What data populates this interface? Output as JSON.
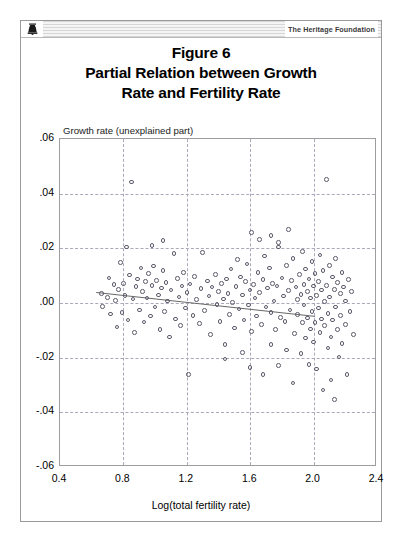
{
  "header": {
    "brand": "The Heritage Foundation",
    "logo_icon": "liberty-bell-icon"
  },
  "title": {
    "line1": "Figure 6",
    "line2": "Partial Relation between Growth",
    "line3": "Rate and Fertility Rate"
  },
  "chart_data": {
    "type": "scatter",
    "xlabel": "Log(total fertility rate)",
    "ylabel": "Growth rate (unexplained part)",
    "xlim": [
      0.4,
      2.4
    ],
    "ylim": [
      -0.06,
      0.06
    ],
    "xticks": [
      "0.4",
      "0.8",
      "1.2",
      "1.6",
      "2.0",
      "2.4"
    ],
    "xtick_values": [
      0.4,
      0.8,
      1.2,
      1.6,
      2.0,
      2.4
    ],
    "yticks": [
      ".06",
      ".04",
      ".02",
      ".00",
      "-.02",
      "-.04",
      "-.06"
    ],
    "ytick_values": [
      0.06,
      0.04,
      0.02,
      0.0,
      -0.02,
      -0.04,
      -0.06
    ],
    "grid": true,
    "grid_style": "dashed",
    "legend": null,
    "marker": "open-circle",
    "marker_color": "#5b5b6b",
    "fit_line": {
      "label": "regression line",
      "color": "#666666",
      "x_start": 0.63,
      "y_start": 0.0035,
      "x_end": 2.02,
      "y_end": -0.0053
    },
    "points": [
      [
        0.66,
        0.0035
      ],
      [
        0.67,
        -0.0012
      ],
      [
        0.7,
        0.002
      ],
      [
        0.71,
        0.0092
      ],
      [
        0.72,
        -0.004
      ],
      [
        0.74,
        0.0068
      ],
      [
        0.75,
        0.001
      ],
      [
        0.76,
        -0.0088
      ],
      [
        0.77,
        0.005
      ],
      [
        0.78,
        0.0148
      ],
      [
        0.79,
        -0.0035
      ],
      [
        0.8,
        0.0072
      ],
      [
        0.81,
        0.0028
      ],
      [
        0.82,
        0.0205
      ],
      [
        0.83,
        -0.0062
      ],
      [
        0.84,
        0.0102
      ],
      [
        0.85,
        0.0442
      ],
      [
        0.86,
        0.0015
      ],
      [
        0.87,
        -0.0108
      ],
      [
        0.88,
        0.006
      ],
      [
        0.89,
        0.0088
      ],
      [
        0.9,
        -0.0025
      ],
      [
        0.91,
        0.0128
      ],
      [
        0.92,
        0.0042
      ],
      [
        0.93,
        -0.007
      ],
      [
        0.94,
        0.0078
      ],
      [
        0.95,
        0.0018
      ],
      [
        0.96,
        0.0108
      ],
      [
        0.97,
        -0.0048
      ],
      [
        0.98,
        0.0065
      ],
      [
        0.99,
        0.0135
      ],
      [
        1.0,
        -0.0015
      ],
      [
        1.01,
        0.0082
      ],
      [
        1.02,
        0.003
      ],
      [
        1.03,
        -0.0098
      ],
      [
        1.04,
        0.0055
      ],
      [
        1.05,
        0.0118
      ],
      [
        1.06,
        -0.0032
      ],
      [
        1.07,
        0.0075
      ],
      [
        1.08,
        0.0008
      ],
      [
        1.09,
        -0.0125
      ],
      [
        1.1,
        0.0048
      ],
      [
        1.12,
        0.0182
      ],
      [
        1.13,
        -0.0058
      ],
      [
        1.14,
        0.009
      ],
      [
        1.15,
        0.0022
      ],
      [
        1.16,
        -0.0082
      ],
      [
        1.17,
        0.0062
      ],
      [
        1.18,
        0.0112
      ],
      [
        1.19,
        -0.0018
      ],
      [
        1.2,
        0.0038
      ],
      [
        1.21,
        -0.0262
      ],
      [
        1.22,
        0.007
      ],
      [
        1.24,
        -0.0045
      ],
      [
        1.25,
        0.0098
      ],
      [
        1.26,
        0.0012
      ],
      [
        1.28,
        -0.0075
      ],
      [
        1.29,
        0.0052
      ],
      [
        1.3,
        0.0185
      ],
      [
        1.31,
        -0.0028
      ],
      [
        1.33,
        0.008
      ],
      [
        1.34,
        0.0025
      ],
      [
        1.35,
        -0.0115
      ],
      [
        1.36,
        0.0058
      ],
      [
        1.38,
        0.0105
      ],
      [
        1.39,
        -0.0005
      ],
      [
        1.4,
        0.0042
      ],
      [
        1.41,
        -0.0068
      ],
      [
        1.42,
        0.0072
      ],
      [
        1.43,
        0.0015
      ],
      [
        1.44,
        -0.0152
      ],
      [
        1.45,
        0.0088
      ],
      [
        1.46,
        0.0035
      ],
      [
        1.47,
        -0.0042
      ],
      [
        1.48,
        0.0125
      ],
      [
        1.49,
        0.0002
      ],
      [
        1.5,
        -0.0092
      ],
      [
        1.51,
        0.006
      ],
      [
        1.52,
        0.016
      ],
      [
        1.53,
        -0.0022
      ],
      [
        1.54,
        0.0095
      ],
      [
        1.55,
        0.003
      ],
      [
        1.56,
        -0.0062
      ],
      [
        1.57,
        0.0078
      ],
      [
        1.58,
        0.0142
      ],
      [
        1.59,
        -0.0008
      ],
      [
        1.6,
        0.0048
      ],
      [
        1.61,
        -0.0105
      ],
      [
        1.62,
        0.0068
      ],
      [
        1.63,
        0.0018
      ],
      [
        1.64,
        -0.0048
      ],
      [
        1.65,
        0.0112
      ],
      [
        1.66,
        0.0038
      ],
      [
        1.67,
        -0.0078
      ],
      [
        1.68,
        0.0085
      ],
      [
        1.69,
        0.0172
      ],
      [
        1.7,
        -0.0015
      ],
      [
        1.71,
        0.0055
      ],
      [
        1.72,
        0.0128
      ],
      [
        1.73,
        -0.0035
      ],
      [
        1.74,
        0.0072
      ],
      [
        1.75,
        0.0008
      ],
      [
        1.76,
        -0.0098
      ],
      [
        1.77,
        0.0062
      ],
      [
        1.78,
        0.0205
      ],
      [
        1.79,
        -0.0052
      ],
      [
        1.8,
        0.0092
      ],
      [
        1.81,
        0.0025
      ],
      [
        1.82,
        -0.0068
      ],
      [
        1.83,
        0.0138
      ],
      [
        1.84,
        0.0045
      ],
      [
        1.85,
        -0.0025
      ],
      [
        1.86,
        0.0082
      ],
      [
        1.87,
        0.0162
      ],
      [
        1.88,
        -0.0112
      ],
      [
        1.89,
        0.0058
      ],
      [
        1.9,
        0.0012
      ],
      [
        1.9,
        -0.0042
      ],
      [
        1.91,
        0.0105
      ],
      [
        1.92,
        -0.0185
      ],
      [
        1.92,
        0.0032
      ],
      [
        1.93,
        -0.0072
      ],
      [
        1.93,
        0.0188
      ],
      [
        1.94,
        0.0068
      ],
      [
        1.94,
        -0.0008
      ],
      [
        1.95,
        0.0125
      ],
      [
        1.95,
        -0.0128
      ],
      [
        1.96,
        0.0042
      ],
      [
        1.96,
        -0.0055
      ],
      [
        1.97,
        0.0088
      ],
      [
        1.97,
        -0.0225
      ],
      [
        1.98,
        0.0018
      ],
      [
        1.98,
        -0.0095
      ],
      [
        1.99,
        0.0152
      ],
      [
        1.99,
        -0.0032
      ],
      [
        2.0,
        0.0062
      ],
      [
        2.0,
        -0.0142
      ],
      [
        2.01,
        0.0108
      ],
      [
        2.01,
        -0.0072
      ],
      [
        2.02,
        0.0028
      ],
      [
        2.02,
        -0.0242
      ],
      [
        2.03,
        0.0078
      ],
      [
        2.03,
        -0.0018
      ],
      [
        2.04,
        0.0175
      ],
      [
        2.04,
        -0.0108
      ],
      [
        2.05,
        0.0048
      ],
      [
        2.05,
        -0.0058
      ],
      [
        2.06,
        0.0118
      ],
      [
        2.06,
        -0.0318
      ],
      [
        2.07,
        0.0005
      ],
      [
        2.07,
        -0.0082
      ],
      [
        2.08,
        0.0452
      ],
      [
        2.08,
        0.0065
      ],
      [
        2.09,
        -0.0038
      ],
      [
        2.09,
        -0.0165
      ],
      [
        2.1,
        0.0138
      ],
      [
        2.1,
        0.0022
      ],
      [
        2.11,
        -0.0125
      ],
      [
        2.11,
        -0.0282
      ],
      [
        2.12,
        0.0095
      ],
      [
        2.12,
        -0.0062
      ],
      [
        2.13,
        0.005
      ],
      [
        2.13,
        -0.0352
      ],
      [
        2.14,
        0.0162
      ],
      [
        2.14,
        -0.0015
      ],
      [
        2.15,
        -0.0098
      ],
      [
        2.15,
        0.0075
      ],
      [
        2.16,
        -0.0198
      ],
      [
        2.17,
        0.0035
      ],
      [
        2.17,
        -0.0045
      ],
      [
        2.18,
        0.0112
      ],
      [
        2.18,
        -0.0148
      ],
      [
        2.19,
        0.0058
      ],
      [
        2.2,
        -0.0078
      ],
      [
        2.2,
        0.0008
      ],
      [
        2.21,
        -0.0262
      ],
      [
        2.22,
        0.0085
      ],
      [
        2.23,
        -0.0032
      ],
      [
        2.24,
        0.0042
      ],
      [
        2.25,
        -0.0115
      ],
      [
        1.44,
        -0.0205
      ],
      [
        1.55,
        -0.0182
      ],
      [
        1.6,
        -0.0235
      ],
      [
        1.68,
        -0.0262
      ],
      [
        1.73,
        -0.0152
      ],
      [
        1.78,
        -0.0228
      ],
      [
        1.83,
        -0.0172
      ],
      [
        1.87,
        -0.0292
      ],
      [
        1.66,
        0.0232
      ],
      [
        1.73,
        0.0248
      ],
      [
        1.78,
        0.0222
      ],
      [
        1.84,
        0.0268
      ],
      [
        1.61,
        0.0258
      ],
      [
        0.98,
        0.021
      ],
      [
        1.05,
        0.0228
      ]
    ]
  },
  "axes": {
    "x_title": "Log(total fertility rate)",
    "y_title": "Growth rate (unexplained part)"
  }
}
